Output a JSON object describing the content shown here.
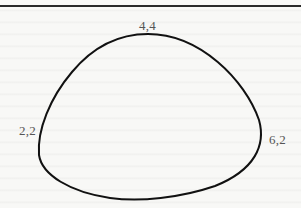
{
  "diagram": {
    "type": "closed-curve",
    "points": [
      {
        "label": "4,4",
        "position": "top"
      },
      {
        "label": "2,2",
        "position": "left"
      },
      {
        "label": "6,2",
        "position": "right"
      }
    ],
    "colors": {
      "curve": "#111111",
      "labels": "#555555",
      "rule": "#2a2a2a"
    }
  }
}
